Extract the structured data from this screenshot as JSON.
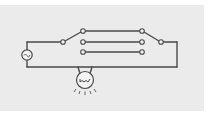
{
  "diagram": {
    "title": "Two-way switching circuit with three-way selector contacts",
    "type": "circuit",
    "colors": {
      "background": "#ebebeb",
      "wire": "#4a4a4a",
      "page": "#ffffff"
    },
    "components": [
      {
        "id": "source",
        "kind": "AC voltage source",
        "symbol": "sine-in-circle"
      },
      {
        "id": "switch-left",
        "kind": "single-pole multi-throw switch",
        "position": "upper contact"
      },
      {
        "id": "switch-right",
        "kind": "single-pole multi-throw switch",
        "position": "upper contact"
      },
      {
        "id": "lamp",
        "kind": "incandescent lamp",
        "state": "lit"
      }
    ],
    "connections": {
      "parallel_wires": 3,
      "left_contacts": 3,
      "right_contacts": 3
    },
    "labels": []
  }
}
